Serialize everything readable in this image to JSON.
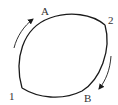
{
  "diagram": {
    "type": "closed-loop-cycle",
    "colors": {
      "stroke": "#1a1a1a",
      "arrow": "#1a1a1a",
      "label": "#333333",
      "background": "#ffffff"
    },
    "points": [
      {
        "id": "1",
        "label": "1"
      },
      {
        "id": "2",
        "label": "2"
      }
    ],
    "paths": [
      {
        "id": "A",
        "label": "A",
        "from": "1",
        "to": "2",
        "direction": "upper arc, 1 to 2"
      },
      {
        "id": "B",
        "label": "B",
        "from": "2",
        "to": "1",
        "direction": "lower arc, 2 to 1"
      }
    ],
    "arrows": [
      {
        "name": "arrow-path-a",
        "along": "A",
        "direction": "up-right"
      },
      {
        "name": "arrow-path-b",
        "along": "B",
        "direction": "down-left"
      }
    ]
  }
}
